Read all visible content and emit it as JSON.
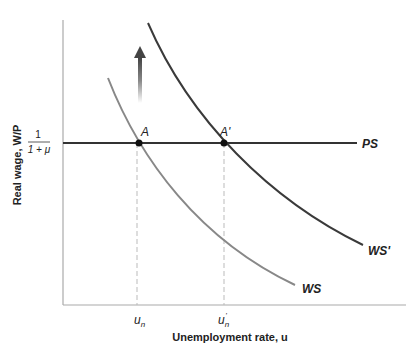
{
  "diagram": {
    "y_axis_label": "Real wage, W/P",
    "x_axis_label": "Unemployment rate, u",
    "ps_level_label_num": "1",
    "ps_level_label_den": "1 + μ",
    "curves": {
      "ps": {
        "label": "PS",
        "color": "#333333"
      },
      "ws": {
        "label": "WS",
        "color": "#888888"
      },
      "ws_prime": {
        "label": "WS'",
        "color": "#3a3a3a"
      }
    },
    "points": {
      "a": {
        "label": "A"
      },
      "a_prime": {
        "label": "A'"
      }
    },
    "x_ticks": {
      "un": "u",
      "un_sub": "n",
      "un_prime": "u",
      "un_prime_sub": "n",
      "un_prime_mark": "'"
    },
    "arrow": {
      "direction": "up",
      "meaning": "shift of WS upward"
    }
  }
}
